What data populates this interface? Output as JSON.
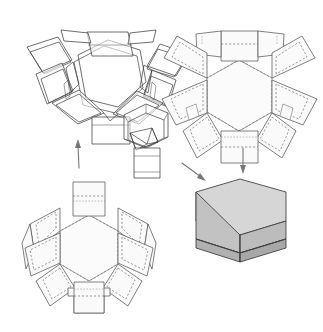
{
  "document": {
    "title": "Hexagonal Box Assembly Diagram",
    "subject": "hexagonal-gift-box",
    "background_color": "#ffffff",
    "width": 323,
    "height": 332,
    "style": "technical line drawing, scanned"
  },
  "colors": {
    "cut_line": "#4a4a4a",
    "fold_line_dashed": "#6a6a6a",
    "panel_fill": "#fafafa",
    "arrow": "#777777",
    "box_top_face": "#d6d6d6",
    "box_left_face": "#c4c4c4",
    "box_front_face": "#bdbdbd",
    "box_right_face": "#a9a9a9",
    "box_base_band": "#b2b2b2",
    "outline_dark": "#3b3b3b"
  },
  "figures": [
    {
      "id": "folded-assembly",
      "data_name": "figure-partially-folded-box",
      "position": "top-left",
      "label": "Partially folded hexagonal box with side panels raised",
      "shape": "hexagonal",
      "panel_count": 6,
      "state": "folding"
    },
    {
      "id": "flat-net-top",
      "data_name": "figure-die-cut-net-lid",
      "position": "top-right",
      "label": "Flat die-cut net of hexagonal lid with six side panels and glue tabs",
      "shape": "hexagonal",
      "panel_count": 6,
      "state": "flat"
    },
    {
      "id": "tray-assembly",
      "data_name": "figure-assembled-tray",
      "position": "center",
      "label": "Open hexagonal tray with inner flaps and neck extension",
      "shape": "hexagonal",
      "panel_count": 6,
      "state": "assembled-open"
    },
    {
      "id": "flat-net-bottom",
      "data_name": "figure-die-cut-net-base",
      "position": "bottom-left",
      "label": "Flat die-cut net of hexagonal base with six side panels and locking tabs",
      "shape": "hexagonal",
      "panel_count": 6,
      "state": "flat"
    },
    {
      "id": "finished-box",
      "data_name": "figure-finished-box",
      "position": "bottom-right",
      "label": "Finished shaded hexagonal box with lid seated on base",
      "shape": "hexagonal",
      "panel_count": 6,
      "state": "complete"
    }
  ],
  "arrows": [
    {
      "id": "arrow-up-left",
      "data_name": "arrow-net-to-folded",
      "direction": "up",
      "from": "flat-net-bottom",
      "to": "folded-assembly"
    },
    {
      "id": "arrow-down-right",
      "data_name": "arrow-net-to-finished",
      "direction": "down",
      "from": "flat-net-top",
      "to": "finished-box"
    },
    {
      "id": "arrow-diagonal",
      "data_name": "arrow-tray-to-finished",
      "direction": "down-right",
      "from": "tray-assembly",
      "to": "finished-box"
    }
  ]
}
